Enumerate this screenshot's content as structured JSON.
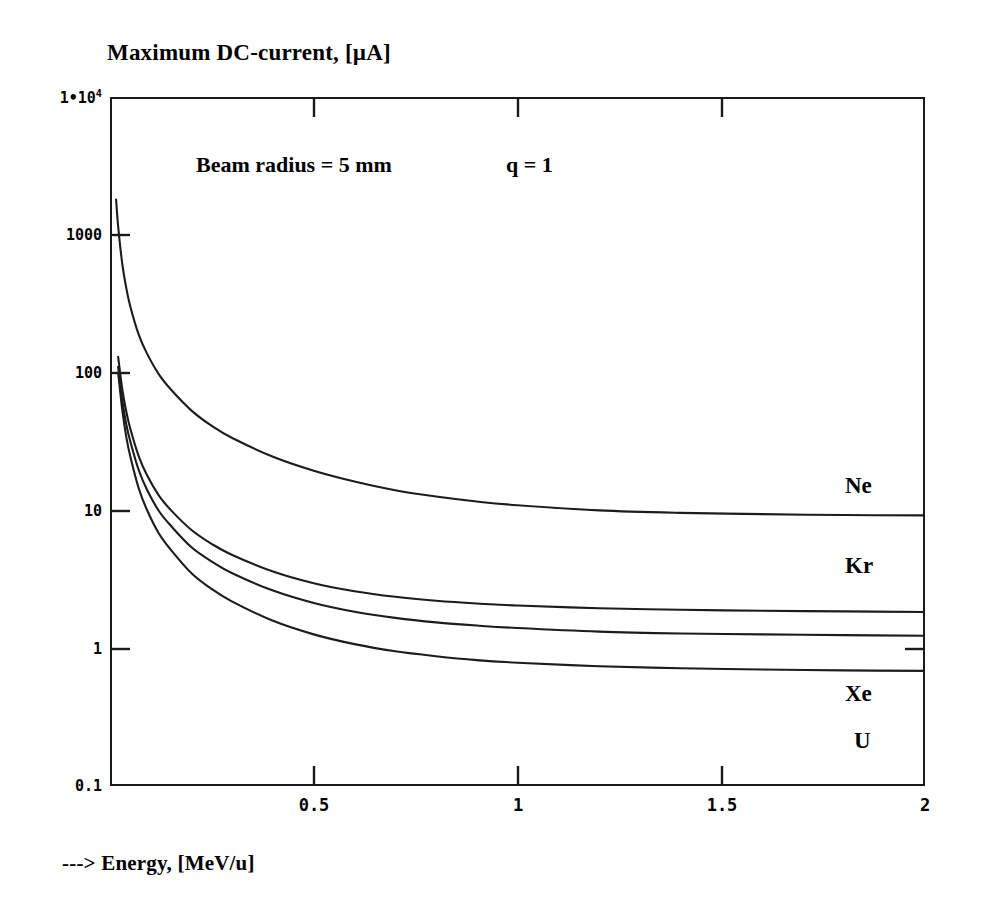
{
  "chart_data": {
    "type": "line",
    "title": "Maximum DC-current, [µA]",
    "ylabel": "Maximum DC-current, [µA]",
    "xlabel": "---> Energy, [MeV/u]",
    "xscale": "linear",
    "yscale": "log",
    "xlim": [
      0,
      2
    ],
    "ylim": [
      0.1,
      10000
    ],
    "grid": false,
    "legend_position": "inline-right",
    "y_tick_labels": [
      "1•10⁴",
      "1000",
      "100",
      "10",
      "1",
      "0.1"
    ],
    "y_tick_values": [
      10000,
      1000,
      100,
      10,
      1,
      0.1
    ],
    "x_tick_labels": [
      "0.5",
      "1",
      "1.5",
      "2"
    ],
    "x_tick_values": [
      0.5,
      1,
      1.5,
      2
    ],
    "annotations": [
      {
        "text": "Beam radius = 5 mm",
        "x": 0.45,
        "y": 2400
      },
      {
        "text": "q = 1",
        "x": 1.05,
        "y": 2400
      }
    ],
    "series": [
      {
        "name": "Ne",
        "label": "Ne",
        "x": [
          0.015,
          0.02,
          0.03,
          0.04,
          0.05,
          0.07,
          0.09,
          0.12,
          0.15,
          0.2,
          0.25,
          0.3,
          0.4,
          0.5,
          0.6,
          0.7,
          0.8,
          0.9,
          1.0,
          1.2,
          1.4,
          1.6,
          1.8,
          2.0
        ],
        "y": [
          1800,
          1150,
          620,
          410,
          300,
          190,
          139,
          97,
          75,
          53,
          41,
          33.5,
          24.5,
          19.4,
          16.2,
          14.0,
          12.6,
          11.6,
          10.9,
          10.0,
          9.6,
          9.4,
          9.25,
          9.2
        ]
      },
      {
        "name": "Kr",
        "label": "Kr",
        "x": [
          0.02,
          0.03,
          0.04,
          0.05,
          0.07,
          0.09,
          0.12,
          0.15,
          0.2,
          0.25,
          0.3,
          0.4,
          0.5,
          0.6,
          0.7,
          0.8,
          0.9,
          1.0,
          1.2,
          1.4,
          1.6,
          1.8,
          2.0
        ],
        "y": [
          130,
          76,
          52,
          39,
          25,
          18.2,
          12.8,
          10.0,
          7.2,
          5.7,
          4.75,
          3.6,
          2.96,
          2.59,
          2.36,
          2.21,
          2.11,
          2.04,
          1.95,
          1.9,
          1.87,
          1.85,
          1.83
        ]
      },
      {
        "name": "Xe",
        "label": "Xe",
        "x": [
          0.02,
          0.03,
          0.04,
          0.05,
          0.07,
          0.09,
          0.12,
          0.15,
          0.2,
          0.25,
          0.3,
          0.4,
          0.5,
          0.6,
          0.7,
          0.8,
          0.9,
          1.0,
          1.2,
          1.4,
          1.6,
          1.8,
          2.0
        ],
        "y": [
          110,
          63,
          42,
          31.5,
          19.8,
          14.3,
          9.9,
          7.7,
          5.4,
          4.25,
          3.5,
          2.62,
          2.13,
          1.84,
          1.66,
          1.54,
          1.46,
          1.4,
          1.32,
          1.28,
          1.26,
          1.245,
          1.23
        ]
      },
      {
        "name": "U",
        "label": "U",
        "x": [
          0.02,
          0.03,
          0.04,
          0.05,
          0.07,
          0.09,
          0.12,
          0.15,
          0.2,
          0.25,
          0.3,
          0.4,
          0.5,
          0.6,
          0.7,
          0.8,
          0.9,
          1.0,
          1.2,
          1.4,
          1.6,
          1.8,
          2.0
        ],
        "y": [
          100,
          54,
          34,
          24.5,
          14.6,
          10.2,
          6.8,
          5.15,
          3.5,
          2.68,
          2.18,
          1.58,
          1.26,
          1.07,
          0.95,
          0.875,
          0.82,
          0.785,
          0.74,
          0.715,
          0.7,
          0.69,
          0.685
        ]
      }
    ]
  },
  "labels": {
    "ylabel_main": "Maximum DC-current, [",
    "ylabel_unit": "µA]",
    "ytop_mantissa": "1•10",
    "ytop_exponent": "4",
    "xlabel_full": "---> Energy, [MeV/u]",
    "curve_ne": "Ne",
    "curve_kr": "Kr",
    "curve_xe": "Xe",
    "curve_u": "U",
    "annot_beam": "Beam radius = 5 mm",
    "annot_q": "q = 1",
    "ytick_1000": "1000",
    "ytick_100": "100",
    "ytick_10": "10",
    "ytick_1": "1",
    "ytick_01": "0.1",
    "xtick_05": "0.5",
    "xtick_1": "1",
    "xtick_15": "1.5",
    "xtick_2": "2"
  },
  "colors": {
    "ink": "#1a1a1a",
    "paper": "#ffffff"
  }
}
